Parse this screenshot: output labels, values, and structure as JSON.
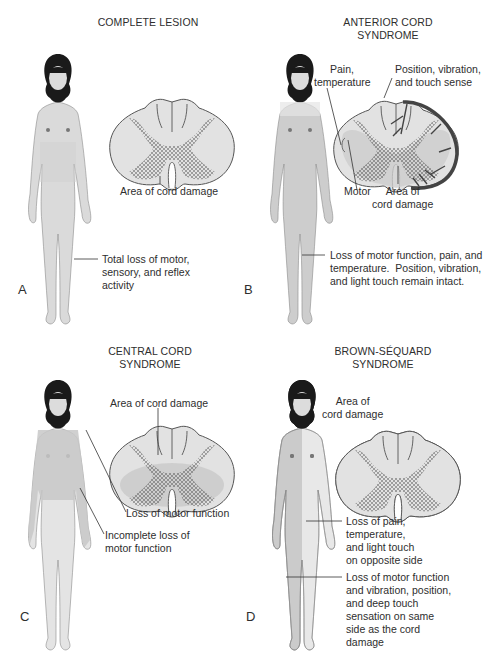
{
  "figure": {
    "panels": [
      {
        "letter": "A",
        "title": [
          "COMPLETE LESION"
        ],
        "labels": {
          "cord_damage": "Area of cord damage",
          "body": [
            "Total loss of motor,",
            "sensory, and reflex",
            "activity"
          ]
        }
      },
      {
        "letter": "B",
        "title": [
          "ANTERIOR CORD",
          "SYNDROME"
        ],
        "labels": {
          "pain": [
            "Pain,",
            "temperature"
          ],
          "position": [
            "Position, vibration,",
            "and touch sense"
          ],
          "motor": "Motor",
          "cord_damage": [
            "Area of",
            "cord damage"
          ],
          "body": [
            "Loss of motor function, pain, and",
            "temperature.  Position, vibration,",
            "and light touch remain intact."
          ]
        }
      },
      {
        "letter": "C",
        "title": [
          "CENTRAL CORD",
          "SYNDROME"
        ],
        "labels": {
          "cord_damage": "Area of cord damage",
          "arm": "Loss of motor function",
          "body": [
            "Incomplete loss of",
            "motor function"
          ]
        }
      },
      {
        "letter": "D",
        "title": [
          "BROWN-SÉQUARD",
          "SYNDROME"
        ],
        "labels": {
          "cord_damage": [
            "Area of",
            "cord damage"
          ],
          "opposite": [
            "Loss of pain,",
            "temperature,",
            "and light touch",
            "on opposite side"
          ],
          "same": [
            "Loss of motor function",
            "and vibration, position,",
            "and deep touch",
            "sensation on same",
            "side as the cord",
            "damage"
          ]
        }
      }
    ],
    "colors": {
      "cord_fill": "#e2e2e2",
      "cord_damage_shade": "#c9c9c9",
      "skin_light": "#e4e4e4",
      "skin_affected": "#cbcbcb",
      "hair": "#1a1a1a",
      "outline": "#555555",
      "vessel": "#4a4a4a"
    }
  }
}
